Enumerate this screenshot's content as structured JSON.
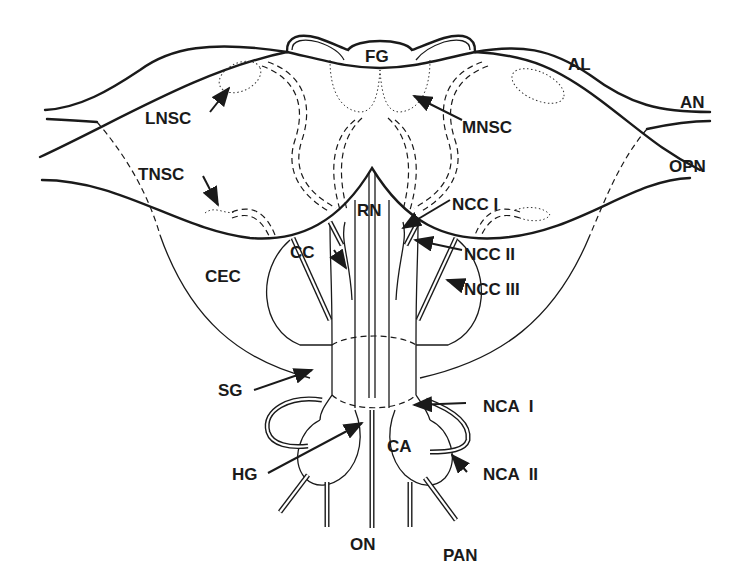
{
  "diagram": {
    "type": "anatomical-schematic",
    "colors": {
      "ink": "#1a1a1a",
      "background": "#ffffff"
    },
    "labels": {
      "fg": "FG",
      "al": "AL",
      "an": "AN",
      "lnsc": "LNSC",
      "mnsc": "MNSC",
      "opn": "OPN",
      "tnsc": "TNSC",
      "rn": "RN",
      "ncc1": "NCC I",
      "ncc2": "NCC II",
      "ncc3": "NCC III",
      "cc": "CC",
      "cec": "CEC",
      "sg": "SG",
      "nca1": "NCA  I",
      "nca2": "NCA  II",
      "ca": "CA",
      "hg": "HG",
      "on": "ON",
      "pan": "PAN"
    }
  }
}
